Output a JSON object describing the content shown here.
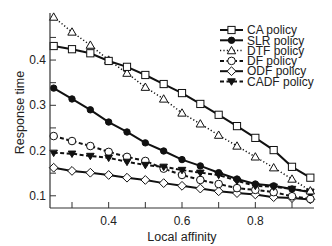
{
  "chart_data": {
    "type": "line",
    "title": "",
    "xlabel": "Local affinity",
    "ylabel": "Response time",
    "xlim": [
      0.24,
      0.96
    ],
    "ylim": [
      0.073,
      0.504
    ],
    "xticks": [
      0.4,
      0.6,
      0.8
    ],
    "xtick_labels": [
      "0.4",
      "0.6",
      "0.8"
    ],
    "xminor_ticks": [
      0.3,
      0.5,
      0.7,
      0.9
    ],
    "yticks": [
      0.1,
      0.2,
      0.3,
      0.4
    ],
    "ytick_labels": [
      "0.1",
      "0.2",
      "0.3",
      "0.4"
    ],
    "yminor_ticks": [
      0.15,
      0.25,
      0.35,
      0.45
    ],
    "grid": false,
    "legend_position": "top-right",
    "x": [
      0.25,
      0.3,
      0.35,
      0.4,
      0.45,
      0.5,
      0.55,
      0.6,
      0.65,
      0.7,
      0.75,
      0.8,
      0.85,
      0.9,
      0.95
    ],
    "series": [
      {
        "name": "CA policy",
        "line": "solid",
        "marker": "square-open",
        "values": [
          0.431,
          0.424,
          0.415,
          0.398,
          0.385,
          0.367,
          0.347,
          0.327,
          0.303,
          0.279,
          0.254,
          0.228,
          0.201,
          0.164,
          0.14
        ]
      },
      {
        "name": "SLR policy",
        "line": "solid",
        "marker": "circle-filled",
        "values": [
          0.338,
          0.314,
          0.29,
          0.263,
          0.241,
          0.217,
          0.199,
          0.18,
          0.166,
          0.151,
          0.137,
          0.126,
          0.122,
          0.115,
          0.108
        ]
      },
      {
        "name": "DTF policy",
        "line": "dotted",
        "marker": "triangle-up-open",
        "values": [
          0.495,
          0.462,
          0.433,
          0.4,
          0.371,
          0.34,
          0.314,
          0.283,
          0.259,
          0.234,
          0.21,
          0.186,
          0.162,
          0.137,
          0.111
        ]
      },
      {
        "name": "DF policy",
        "line": "dashed",
        "marker": "circle-open",
        "values": [
          0.232,
          0.221,
          0.21,
          0.197,
          0.186,
          0.177,
          0.16,
          0.146,
          0.135,
          0.126,
          0.117,
          0.113,
          0.108,
          0.099,
          0.093
        ]
      },
      {
        "name": "ODF policy",
        "line": "solid",
        "marker": "diamond-open",
        "values": [
          0.162,
          0.155,
          0.151,
          0.146,
          0.14,
          0.135,
          0.128,
          0.122,
          0.116,
          0.11,
          0.106,
          0.103,
          0.097,
          0.095,
          0.092
        ]
      },
      {
        "name": "CADF policy",
        "line": "dashed",
        "marker": "triangle-down-filled",
        "values": [
          0.195,
          0.193,
          0.188,
          0.184,
          0.175,
          0.168,
          0.164,
          0.157,
          0.151,
          0.146,
          0.133,
          0.122,
          0.12,
          0.115,
          0.109
        ]
      }
    ]
  }
}
